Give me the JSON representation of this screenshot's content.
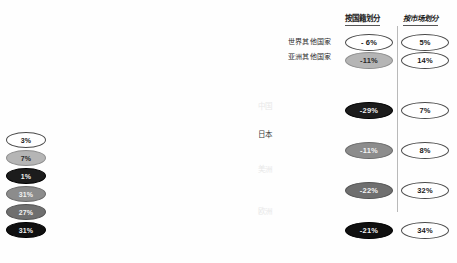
{
  "chart_data": {
    "type": "area",
    "title": "",
    "xlabel": "",
    "ylabel": "",
    "stacked": true,
    "grid": false,
    "legend": "in-plot",
    "x": [
      1995,
      1996,
      1997,
      1998,
      1999,
      2000,
      2001,
      2002,
      2003,
      2004,
      2005,
      2006,
      2007,
      2008,
      2009,
      2010,
      2011,
      2012,
      2013
    ],
    "xtick_labels": [
      "1995",
      "2000",
      "2005",
      "2010",
      "2013预期"
    ],
    "xtick_positions": [
      1995,
      2000,
      2005,
      2010,
      2013
    ],
    "series": [
      {
        "name": "欧洲",
        "color": "#101010",
        "values": [
          22,
          24,
          26,
          28,
          30,
          33,
          34,
          34,
          33,
          35,
          37,
          40,
          43,
          42,
          38,
          42,
          47,
          50,
          54
        ]
      },
      {
        "name": "美洲",
        "color": "#6f6f6f",
        "values": [
          18,
          19,
          21,
          22,
          24,
          26,
          26,
          25,
          25,
          27,
          29,
          31,
          33,
          32,
          29,
          32,
          36,
          38,
          41
        ]
      },
      {
        "name": "日本",
        "color": "#a9a9a9",
        "values": [
          24,
          25,
          26,
          26,
          27,
          28,
          27,
          26,
          25,
          25,
          25,
          25,
          25,
          23,
          21,
          21,
          21,
          20,
          20
        ]
      },
      {
        "name": "中国",
        "color": "#242424",
        "values": [
          1,
          1,
          2,
          2,
          3,
          4,
          5,
          6,
          7,
          9,
          11,
          14,
          17,
          18,
          17,
          22,
          28,
          32,
          36
        ]
      },
      {
        "name": "亚洲其他国家",
        "color": "#c8c8c8",
        "values": [
          7,
          7,
          8,
          8,
          9,
          10,
          10,
          10,
          10,
          11,
          12,
          13,
          14,
          14,
          13,
          15,
          17,
          18,
          19
        ]
      },
      {
        "name": "世界其他国家",
        "color": "#ffffff",
        "values": [
          3,
          3,
          3,
          4,
          4,
          5,
          5,
          5,
          5,
          5,
          6,
          6,
          7,
          7,
          6,
          7,
          8,
          9,
          10
        ]
      }
    ],
    "annotations": {
      "in_plot_labels": [
        "中国",
        "日本",
        "美洲",
        "欧洲"
      ],
      "callout_labels": [
        "世界其他国家",
        "亚洲其他国家"
      ]
    }
  },
  "left_column": {
    "name": "1995年份额",
    "cells": [
      {
        "value": "3%",
        "style": "white"
      },
      {
        "value": "7%",
        "style": "lgray"
      },
      {
        "value": "1%",
        "style": "dark"
      },
      {
        "value": "31%",
        "style": "mgray"
      },
      {
        "value": "27%",
        "style": "dgray"
      },
      {
        "value": "31%",
        "style": "black"
      }
    ]
  },
  "columns": {
    "nationality": {
      "header": "按国籍划分",
      "cells": [
        {
          "value": "- 6%",
          "style": "white"
        },
        {
          "value": "-11%",
          "style": "lgray"
        },
        {
          "value": "-29%",
          "style": "dark"
        },
        {
          "value": "-11%",
          "style": "mgray"
        },
        {
          "value": "-22%",
          "style": "dgray"
        },
        {
          "value": "-21%",
          "style": "black"
        }
      ]
    },
    "market": {
      "header": "按市场划分",
      "cells": [
        {
          "value": "5%",
          "style": "white"
        },
        {
          "value": "14%",
          "style": "white"
        },
        {
          "value": "7%",
          "style": "white"
        },
        {
          "value": "8%",
          "style": "white"
        },
        {
          "value": "32%",
          "style": "white"
        },
        {
          "value": "34%",
          "style": "white"
        }
      ]
    }
  },
  "axis": {
    "ticks": [
      {
        "label": "1995",
        "suffix": ""
      },
      {
        "label": "2000",
        "suffix": ""
      },
      {
        "label": "2005",
        "suffix": ""
      },
      {
        "label": "2010",
        "suffix": ""
      },
      {
        "label": "2013",
        "suffix": "预期"
      }
    ]
  }
}
